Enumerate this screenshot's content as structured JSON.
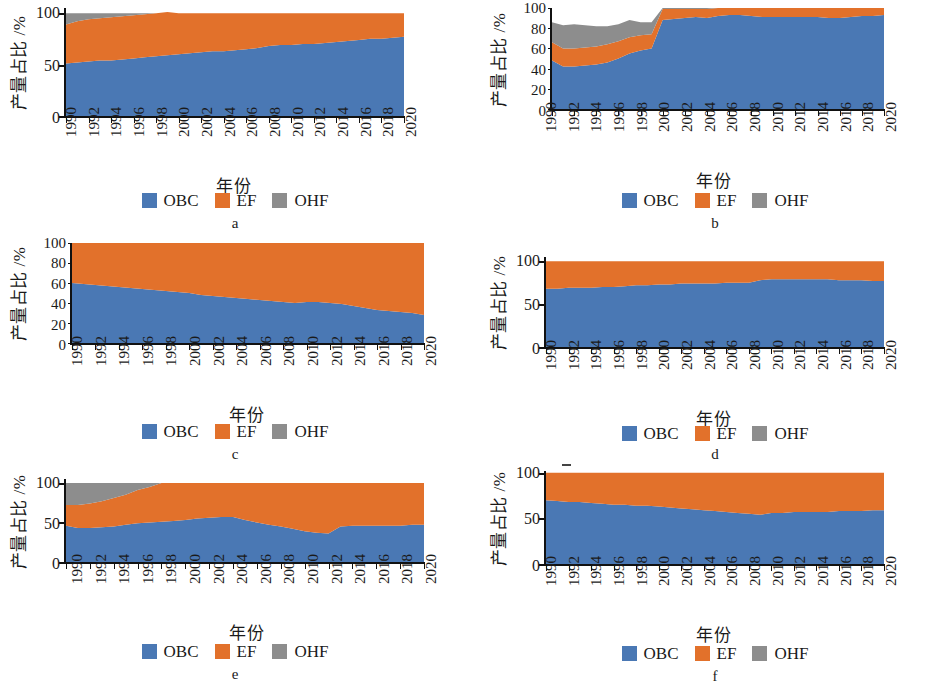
{
  "figure": {
    "axis_titles": {
      "y": "产量占比 /%",
      "x": "年份"
    },
    "legend": [
      {
        "label": "OBC",
        "color": "#4a78b4",
        "icon": "legend-swatch"
      },
      {
        "label": "EF",
        "color": "#e2712b",
        "icon": "legend-swatch"
      },
      {
        "label": "OHF",
        "color": "#8d8d8d",
        "icon": "legend-swatch"
      }
    ],
    "colors": {
      "obc": "#4a78b4",
      "ef": "#e2712b",
      "ohf": "#8d8d8d",
      "axis": "#111111",
      "background": "#ffffff"
    },
    "panel_letters": [
      "a",
      "b",
      "c",
      "d",
      "e",
      "f"
    ],
    "x_tick_labels": [
      "1990",
      "1992",
      "1994",
      "1996",
      "1998",
      "2000",
      "2002",
      "2004",
      "2006",
      "2008",
      "2010",
      "2012",
      "2014",
      "2016",
      "2018",
      "2020"
    ],
    "y_ticks_coarse": [
      "100",
      "50",
      "0"
    ],
    "y_ticks_fine": [
      "100",
      "80",
      "60",
      "40",
      "20",
      "0"
    ]
  },
  "chart_data": [
    {
      "id": "a",
      "type": "area",
      "stacked": true,
      "normalized": true,
      "title": "a",
      "xlabel": "年份",
      "ylabel": "产量占比 /%",
      "xlim": [
        1990,
        2020
      ],
      "ylim": [
        0,
        105
      ],
      "yticks": [
        0,
        50,
        100
      ],
      "ytick_labels": [
        "0",
        "50",
        "100"
      ],
      "grid": false,
      "legend_position": "below",
      "x": [
        1990,
        1991,
        1992,
        1993,
        1994,
        1995,
        1996,
        1997,
        1998,
        1999,
        2000,
        2001,
        2002,
        2003,
        2004,
        2005,
        2006,
        2007,
        2008,
        2009,
        2010,
        2011,
        2012,
        2013,
        2014,
        2015,
        2016,
        2017,
        2018,
        2019,
        2020
      ],
      "series": [
        {
          "name": "OBC",
          "color": "#4a78b4",
          "values": [
            51,
            52,
            53,
            54,
            54,
            55,
            56,
            57,
            58,
            59,
            60,
            61,
            62,
            63,
            63,
            64,
            65,
            66,
            68,
            69,
            69,
            70,
            70,
            71,
            72,
            73,
            74,
            75,
            75,
            76,
            77
          ]
        },
        {
          "name": "EF",
          "color": "#e2712b",
          "values": [
            38,
            40,
            41,
            41,
            42,
            42,
            42,
            42,
            42,
            42,
            40,
            39,
            38,
            37,
            37,
            36,
            35,
            34,
            32,
            31,
            31,
            30,
            30,
            29,
            28,
            27,
            26,
            25,
            25,
            24,
            23
          ]
        },
        {
          "name": "OHF",
          "color": "#8d8d8d",
          "values": [
            11,
            8,
            6,
            5,
            4,
            3,
            2,
            1,
            0,
            0,
            0,
            0,
            0,
            0,
            0,
            0,
            0,
            0,
            0,
            0,
            0,
            0,
            0,
            0,
            0,
            0,
            0,
            0,
            0,
            0,
            0
          ]
        }
      ]
    },
    {
      "id": "b",
      "type": "area",
      "stacked": true,
      "normalized": true,
      "title": "b",
      "xlabel": "年份",
      "ylabel": "产量占比 /%",
      "xlim": [
        1990,
        2020
      ],
      "ylim": [
        0,
        100
      ],
      "yticks": [
        0,
        20,
        40,
        60,
        80,
        100
      ],
      "ytick_labels": [
        "0",
        "20",
        "40",
        "60",
        "80",
        "100"
      ],
      "grid": false,
      "legend_position": "below",
      "x": [
        1990,
        1991,
        1992,
        1993,
        1994,
        1995,
        1996,
        1997,
        1998,
        1999,
        2000,
        2001,
        2002,
        2003,
        2004,
        2005,
        2006,
        2007,
        2008,
        2009,
        2010,
        2011,
        2012,
        2013,
        2014,
        2015,
        2016,
        2017,
        2018,
        2019,
        2020
      ],
      "series": [
        {
          "name": "OBC",
          "color": "#4a78b4",
          "values": [
            48,
            42,
            42,
            43,
            44,
            46,
            50,
            55,
            58,
            60,
            88,
            89,
            90,
            91,
            90,
            92,
            93,
            93,
            92,
            91,
            91,
            91,
            91,
            91,
            91,
            90,
            90,
            91,
            92,
            92,
            93
          ]
        },
        {
          "name": "EF",
          "color": "#e2712b",
          "values": [
            18,
            18,
            18,
            18,
            18,
            18,
            17,
            16,
            15,
            14,
            11,
            10,
            9,
            8,
            9,
            8,
            7,
            7,
            8,
            9,
            9,
            9,
            9,
            9,
            9,
            10,
            10,
            9,
            8,
            8,
            7
          ]
        },
        {
          "name": "OHF",
          "color": "#8d8d8d",
          "values": [
            20,
            23,
            24,
            22,
            20,
            18,
            17,
            17,
            13,
            12,
            1,
            1,
            1,
            1,
            1,
            0,
            0,
            0,
            0,
            0,
            0,
            0,
            0,
            0,
            0,
            0,
            0,
            0,
            0,
            0,
            0
          ]
        }
      ]
    },
    {
      "id": "c",
      "type": "area",
      "stacked": true,
      "normalized": true,
      "title": "c",
      "xlabel": "年份",
      "ylabel": "产量占比 /%",
      "xlim": [
        1990,
        2020
      ],
      "ylim": [
        0,
        100
      ],
      "yticks": [
        0,
        20,
        40,
        60,
        80,
        100
      ],
      "ytick_labels": [
        "0",
        "20",
        "40",
        "60",
        "80",
        "100"
      ],
      "grid": false,
      "legend_position": "below",
      "x": [
        1990,
        1991,
        1992,
        1993,
        1994,
        1995,
        1996,
        1997,
        1998,
        1999,
        2000,
        2001,
        2002,
        2003,
        2004,
        2005,
        2006,
        2007,
        2008,
        2009,
        2010,
        2011,
        2012,
        2013,
        2014,
        2015,
        2016,
        2017,
        2018,
        2019,
        2020
      ],
      "series": [
        {
          "name": "OBC",
          "color": "#4a78b4",
          "values": [
            60,
            59,
            58,
            57,
            56,
            55,
            54,
            53,
            52,
            51,
            50,
            48,
            47,
            46,
            45,
            44,
            43,
            42,
            41,
            40,
            41,
            41,
            40,
            39,
            37,
            35,
            33,
            32,
            31,
            30,
            28
          ]
        },
        {
          "name": "EF",
          "color": "#e2712b",
          "values": [
            40,
            41,
            42,
            43,
            44,
            45,
            46,
            47,
            48,
            49,
            50,
            52,
            53,
            54,
            55,
            56,
            57,
            58,
            59,
            60,
            59,
            59,
            60,
            61,
            63,
            65,
            67,
            68,
            69,
            70,
            72
          ]
        },
        {
          "name": "OHF",
          "color": "#8d8d8d",
          "values": [
            0,
            0,
            0,
            0,
            0,
            0,
            0,
            0,
            0,
            0,
            0,
            0,
            0,
            0,
            0,
            0,
            0,
            0,
            0,
            0,
            0,
            0,
            0,
            0,
            0,
            0,
            0,
            0,
            0,
            0,
            0
          ]
        }
      ]
    },
    {
      "id": "d",
      "type": "area",
      "stacked": true,
      "normalized": true,
      "title": "d",
      "xlabel": "年份",
      "ylabel": "产量占比 /%",
      "xlim": [
        1990,
        2020
      ],
      "ylim": [
        0,
        105
      ],
      "yticks": [
        0,
        50,
        100
      ],
      "ytick_labels": [
        "0",
        "50",
        "100"
      ],
      "grid": false,
      "legend_position": "below",
      "x": [
        1990,
        1991,
        1992,
        1993,
        1994,
        1995,
        1996,
        1997,
        1998,
        1999,
        2000,
        2001,
        2002,
        2003,
        2004,
        2005,
        2006,
        2007,
        2008,
        2009,
        2010,
        2011,
        2012,
        2013,
        2014,
        2015,
        2016,
        2017,
        2018,
        2019,
        2020
      ],
      "series": [
        {
          "name": "OBC",
          "color": "#4a78b4",
          "values": [
            68,
            68,
            69,
            69,
            69,
            70,
            70,
            71,
            72,
            72,
            73,
            73,
            74,
            74,
            74,
            74,
            75,
            75,
            75,
            78,
            79,
            79,
            79,
            79,
            79,
            79,
            78,
            78,
            78,
            77,
            77
          ]
        },
        {
          "name": "EF",
          "color": "#e2712b",
          "values": [
            32,
            32,
            31,
            31,
            31,
            30,
            30,
            29,
            28,
            28,
            27,
            27,
            26,
            26,
            26,
            26,
            25,
            25,
            25,
            22,
            21,
            21,
            21,
            21,
            21,
            21,
            22,
            22,
            22,
            23,
            23
          ]
        },
        {
          "name": "OHF",
          "color": "#8d8d8d",
          "values": [
            0,
            0,
            0,
            0,
            0,
            0,
            0,
            0,
            0,
            0,
            0,
            0,
            0,
            0,
            0,
            0,
            0,
            0,
            0,
            0,
            0,
            0,
            0,
            0,
            0,
            0,
            0,
            0,
            0,
            0,
            0
          ]
        }
      ]
    },
    {
      "id": "e",
      "type": "area",
      "stacked": true,
      "normalized": true,
      "title": "e",
      "xlabel": "年份",
      "ylabel": "产量占比 /%",
      "xlim": [
        1990,
        2020
      ],
      "ylim": [
        0,
        105
      ],
      "yticks": [
        0,
        50,
        100
      ],
      "ytick_labels": [
        "0",
        "50",
        "100"
      ],
      "grid": false,
      "legend_position": "below",
      "x": [
        1990,
        1991,
        1992,
        1993,
        1994,
        1995,
        1996,
        1997,
        1998,
        1999,
        2000,
        2001,
        2002,
        2003,
        2004,
        2005,
        2006,
        2007,
        2008,
        2009,
        2010,
        2011,
        2012,
        2013,
        2014,
        2015,
        2016,
        2017,
        2018,
        2019,
        2020
      ],
      "series": [
        {
          "name": "OBC",
          "color": "#4a78b4",
          "values": [
            46,
            43,
            43,
            44,
            45,
            47,
            49,
            50,
            51,
            52,
            53,
            55,
            56,
            57,
            57,
            53,
            50,
            47,
            45,
            42,
            39,
            37,
            36,
            45,
            46,
            46,
            46,
            46,
            46,
            47,
            47
          ]
        },
        {
          "name": "EF",
          "color": "#e2712b",
          "values": [
            26,
            29,
            31,
            33,
            36,
            38,
            42,
            45,
            49,
            48,
            47,
            45,
            44,
            43,
            43,
            47,
            50,
            53,
            55,
            58,
            61,
            63,
            64,
            55,
            54,
            54,
            54,
            54,
            54,
            53,
            53
          ]
        },
        {
          "name": "OHF",
          "color": "#8d8d8d",
          "values": [
            28,
            28,
            26,
            23,
            19,
            15,
            9,
            5,
            0,
            0,
            0,
            0,
            0,
            0,
            0,
            0,
            0,
            0,
            0,
            0,
            0,
            0,
            0,
            0,
            0,
            0,
            0,
            0,
            0,
            0,
            0
          ]
        }
      ]
    },
    {
      "id": "f",
      "type": "area",
      "stacked": true,
      "normalized": true,
      "title": "f",
      "xlabel": "年份",
      "ylabel": "产量占比 /%",
      "xlim": [
        1990,
        2020
      ],
      "ylim": [
        0,
        102
      ],
      "yticks": [
        0,
        50,
        100
      ],
      "ytick_labels": [
        "0",
        "50",
        "100"
      ],
      "grid": false,
      "legend_position": "below",
      "x": [
        1990,
        1991,
        1992,
        1993,
        1994,
        1995,
        1996,
        1997,
        1998,
        1999,
        2000,
        2001,
        2002,
        2003,
        2004,
        2005,
        2006,
        2007,
        2008,
        2009,
        2010,
        2011,
        2012,
        2013,
        2014,
        2015,
        2016,
        2017,
        2018,
        2019,
        2020
      ],
      "series": [
        {
          "name": "OBC",
          "color": "#4a78b4",
          "values": [
            70,
            69,
            68,
            68,
            67,
            66,
            65,
            65,
            64,
            64,
            63,
            62,
            61,
            60,
            59,
            58,
            57,
            56,
            55,
            54,
            56,
            56,
            57,
            57,
            57,
            57,
            58,
            58,
            58,
            59,
            59
          ]
        },
        {
          "name": "EF",
          "color": "#e2712b",
          "values": [
            30,
            31,
            32,
            32,
            33,
            34,
            35,
            35,
            36,
            36,
            37,
            38,
            39,
            40,
            41,
            42,
            43,
            44,
            45,
            46,
            44,
            44,
            43,
            43,
            43,
            43,
            42,
            42,
            42,
            41,
            41
          ]
        },
        {
          "name": "OHF",
          "color": "#8d8d8d",
          "values": [
            0,
            0,
            0,
            0,
            0,
            0,
            0,
            0,
            0,
            0,
            0,
            0,
            0,
            0,
            0,
            0,
            0,
            0,
            0,
            0,
            0,
            0,
            0,
            0,
            0,
            0,
            0,
            0,
            0,
            0,
            0
          ]
        }
      ]
    }
  ]
}
